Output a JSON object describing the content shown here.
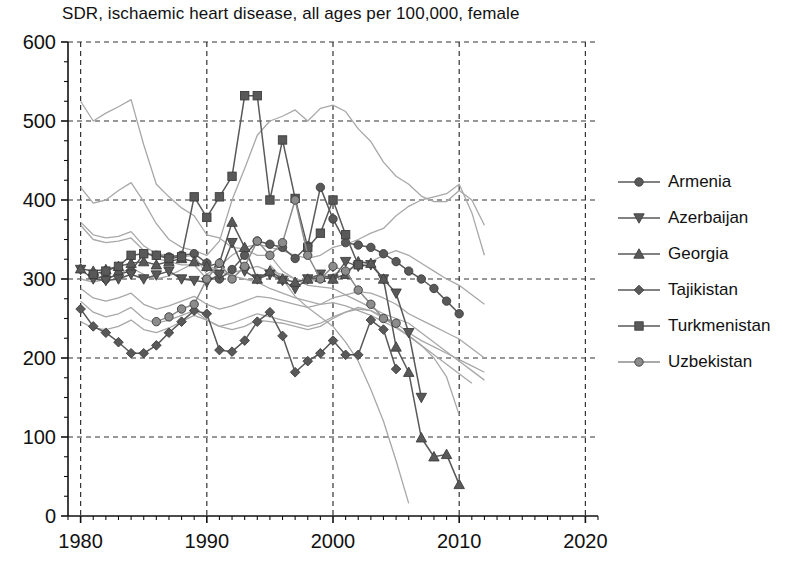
{
  "chart_data": {
    "type": "line",
    "title": "SDR, ischaemic heart disease, all ages per 100,000, female",
    "xlabel": "",
    "ylabel": "",
    "xlim": [
      1979,
      2021
    ],
    "ylim": [
      0,
      600
    ],
    "xticks": [
      "1980",
      "1990",
      "2000",
      "2010",
      "2020"
    ],
    "yticks": [
      "0",
      "100",
      "200",
      "300",
      "400",
      "500",
      "600"
    ],
    "xtick_values": [
      1980,
      1990,
      2000,
      2010,
      2020
    ],
    "ytick_values": [
      0,
      100,
      200,
      300,
      400,
      500,
      600
    ],
    "x_minor_step": 1,
    "y_minor_step": 25,
    "grid": "dashed",
    "legend_position": "right",
    "colors": {
      "highlight": "#595959",
      "background_line": "#a8a8a8",
      "axis": "#111111",
      "grid": "#333333"
    },
    "series": [
      {
        "name": "Armenia",
        "marker": "circle",
        "highlight": true,
        "color": "#595959",
        "x": [
          1981,
          1982,
          1983,
          1984,
          1985,
          1986,
          1987,
          1988,
          1989,
          1990,
          1991,
          1992,
          1993,
          1994,
          1995,
          1996,
          1997,
          1998,
          1999,
          2000,
          2001,
          2002,
          2003,
          2004,
          2005,
          2006,
          2007,
          2008,
          2009,
          2010
        ],
        "y": [
          304,
          300,
          306,
          310,
          332,
          330,
          328,
          330,
          332,
          320,
          300,
          312,
          330,
          348,
          344,
          340,
          326,
          342,
          416,
          376,
          346,
          343,
          340,
          332,
          322,
          310,
          300,
          288,
          272,
          256
        ]
      },
      {
        "name": "Azerbaijan",
        "marker": "triangle-down",
        "highlight": true,
        "color": "#595959",
        "x": [
          1980,
          1981,
          1982,
          1983,
          1984,
          1985,
          1986,
          1987,
          1988,
          1989,
          1990,
          1991,
          1992,
          1993,
          1994,
          1995,
          1996,
          1997,
          1998,
          1999,
          2000,
          2001,
          2002,
          2003,
          2004,
          2005,
          2006,
          2007
        ],
        "y": [
          312,
          300,
          298,
          300,
          306,
          300,
          305,
          310,
          300,
          298,
          296,
          306,
          346,
          310,
          300,
          306,
          298,
          288,
          300,
          306,
          300,
          322,
          316,
          318,
          300,
          282,
          232,
          150
        ]
      },
      {
        "name": "Georgia",
        "marker": "triangle-up",
        "highlight": true,
        "color": "#595959",
        "x": [
          1980,
          1981,
          1982,
          1983,
          1984,
          1985,
          1986,
          1987,
          1988,
          1989,
          1990,
          1991,
          1992,
          1993,
          1994,
          1995,
          1996,
          1997,
          1998,
          1999,
          2000,
          2001,
          2002,
          2003,
          2004,
          2005,
          2006,
          2007,
          2008,
          2009,
          2010
        ],
        "y": [
          313,
          310,
          312,
          316,
          320,
          322,
          318,
          322,
          326,
          322,
          316,
          320,
          372,
          340,
          300,
          310,
          300,
          296,
          300,
          302,
          300,
          306,
          322,
          320,
          300,
          214,
          182,
          99,
          75,
          78,
          40
        ]
      },
      {
        "name": "Tajikistan",
        "marker": "diamond",
        "highlight": true,
        "color": "#595959",
        "x": [
          1980,
          1981,
          1982,
          1983,
          1984,
          1985,
          1986,
          1987,
          1988,
          1989,
          1990,
          1991,
          1992,
          1993,
          1994,
          1995,
          1996,
          1997,
          1998,
          1999,
          2000,
          2001,
          2002,
          2003,
          2004,
          2005
        ],
        "y": [
          262,
          240,
          232,
          220,
          206,
          206,
          216,
          232,
          246,
          260,
          256,
          210,
          208,
          222,
          246,
          258,
          228,
          182,
          196,
          206,
          222,
          204,
          204,
          248,
          236,
          186
        ]
      },
      {
        "name": "Turkmenistan",
        "marker": "square",
        "highlight": true,
        "color": "#595959",
        "x": [
          1981,
          1982,
          1983,
          1984,
          1985,
          1986,
          1987,
          1988,
          1989,
          1990,
          1991,
          1992,
          1993,
          1994,
          1995,
          1996,
          1997,
          1998,
          1999,
          2000,
          2001,
          2002
        ],
        "y": [
          306,
          310,
          316,
          330,
          332,
          330,
          326,
          328,
          404,
          378,
          404,
          430,
          532,
          532,
          400,
          476,
          402,
          340,
          358,
          400,
          356,
          318
        ]
      },
      {
        "name": "Uzbekistan",
        "marker": "circle-light",
        "highlight": true,
        "color": "#8c8c8c",
        "x": [
          1986,
          1987,
          1988,
          1989,
          1990,
          1991,
          1992,
          1993,
          1994,
          1995,
          1996,
          1997,
          1998,
          1999,
          2000,
          2001,
          2002,
          2003,
          2004,
          2005
        ],
        "y": [
          246,
          252,
          262,
          268,
          300,
          320,
          300,
          316,
          348,
          330,
          346,
          400,
          330,
          300,
          316,
          310,
          286,
          268,
          250,
          244
        ]
      }
    ],
    "background_series": [
      {
        "name": "background-1",
        "x": [
          1980,
          1981,
          1982,
          1983,
          1984,
          1985,
          1986,
          1987,
          1988,
          1989,
          1990,
          1991,
          1992,
          1993,
          1994,
          1995,
          1996,
          1997,
          1998,
          1999,
          2000,
          2001,
          2002,
          2003,
          2004,
          2005,
          2006,
          2007,
          2008,
          2009,
          2010,
          2011,
          2012
        ],
        "y": [
          525,
          500,
          510,
          518,
          527,
          470,
          420,
          404,
          390,
          380,
          356,
          352,
          340,
          338,
          330,
          330,
          310,
          300,
          292,
          290,
          288,
          280,
          272,
          264,
          256,
          250,
          244,
          232,
          220,
          208,
          196,
          184,
          172
        ]
      },
      {
        "name": "background-2",
        "x": [
          1980,
          1981,
          1982,
          1983,
          1984,
          1985,
          1986,
          1987,
          1988,
          1989,
          1990,
          1991,
          1992,
          1993,
          1994,
          1995,
          1996,
          1997,
          1998,
          1999,
          2000,
          2001,
          2002,
          2003,
          2004,
          2005,
          2006,
          2007,
          2008,
          2009,
          2010,
          2011,
          2012
        ],
        "y": [
          416,
          396,
          400,
          412,
          422,
          398,
          370,
          350,
          340,
          336,
          330,
          348,
          400,
          440,
          482,
          500,
          506,
          514,
          500,
          516,
          520,
          512,
          490,
          474,
          448,
          430,
          420,
          405,
          398,
          398,
          412,
          400,
          368
        ]
      },
      {
        "name": "background-3",
        "x": [
          1980,
          1981,
          1982,
          1983,
          1984,
          1985,
          1986,
          1987,
          1988,
          1989,
          1990,
          1991,
          1992,
          1993,
          1994,
          1995,
          1996,
          1997,
          1998,
          1999,
          2000,
          2001,
          2002,
          2003,
          2004,
          2005,
          2006,
          2007,
          2008,
          2009,
          2010,
          2011,
          2012
        ],
        "y": [
          372,
          356,
          352,
          354,
          360,
          342,
          332,
          330,
          328,
          330,
          306,
          316,
          330,
          340,
          344,
          340,
          336,
          330,
          326,
          330,
          340,
          344,
          350,
          358,
          364,
          380,
          392,
          400,
          404,
          408,
          420,
          384,
          330
        ]
      },
      {
        "name": "background-4",
        "x": [
          1980,
          1981,
          1982,
          1983,
          1984,
          1985,
          1986,
          1987,
          1988,
          1989,
          1990,
          1991,
          1992,
          1993,
          1994,
          1995,
          1996,
          1997,
          1998,
          1999,
          2000,
          2001,
          2002,
          2003,
          2004,
          2005,
          2006,
          2007,
          2008,
          2009,
          2010,
          2011,
          2012
        ],
        "y": [
          368,
          350,
          346,
          348,
          352,
          336,
          326,
          322,
          318,
          318,
          300,
          302,
          308,
          312,
          316,
          310,
          306,
          300,
          296,
          300,
          306,
          312,
          316,
          322,
          330,
          336,
          330,
          320,
          310,
          300,
          292,
          280,
          268
        ]
      },
      {
        "name": "background-5",
        "x": [
          1980,
          1981,
          1982,
          1983,
          1984,
          1985,
          1986,
          1987,
          1988,
          1989,
          1990,
          1991,
          1992,
          1993,
          1994,
          1995,
          1996,
          1997,
          1998,
          1999,
          2000,
          2001,
          2002,
          2003,
          2004,
          2005,
          2006,
          2007,
          2008,
          2009,
          2010,
          2011,
          2012
        ],
        "y": [
          288,
          276,
          272,
          276,
          282,
          268,
          262,
          266,
          272,
          278,
          268,
          262,
          266,
          272,
          278,
          276,
          272,
          268,
          264,
          268,
          276,
          280,
          284,
          282,
          276,
          268,
          256,
          248,
          240,
          232,
          224,
          212,
          200
        ]
      },
      {
        "name": "background-6",
        "x": [
          1980,
          1981,
          1982,
          1983,
          1984,
          1985,
          1986,
          1987,
          1988,
          1989,
          1990,
          1991,
          1992,
          1993,
          1994,
          1995,
          1996,
          1997,
          1998,
          1999,
          2000,
          2001,
          2002,
          2003,
          2004,
          2005,
          2006,
          2007,
          2008,
          2009,
          2010,
          2011,
          2012
        ],
        "y": [
          272,
          258,
          252,
          256,
          264,
          250,
          244,
          248,
          254,
          260,
          248,
          240,
          244,
          250,
          256,
          252,
          248,
          244,
          240,
          244,
          252,
          258,
          262,
          260,
          252,
          244,
          232,
          222,
          214,
          206,
          198,
          190,
          182
        ]
      },
      {
        "name": "background-7",
        "x": [
          1980,
          1981,
          1982,
          1983,
          1984,
          1985,
          1986,
          1987,
          1988,
          1989,
          1990,
          1991,
          1992,
          1993,
          1994,
          1995,
          1996,
          1997,
          1998,
          1999,
          2000,
          2001,
          2002,
          2003,
          2004,
          2005,
          2006,
          2007,
          2008,
          2009,
          2010
        ],
        "y": [
          300,
          296,
          300,
          306,
          314,
          306,
          300,
          304,
          312,
          320,
          318,
          310,
          304,
          300,
          296,
          288,
          282,
          276,
          272,
          268,
          270,
          266,
          260,
          254,
          246,
          238,
          228,
          216,
          200,
          176,
          128
        ]
      },
      {
        "name": "background-8",
        "x": [
          1995,
          1996,
          1997,
          1998,
          1999,
          2000,
          2001,
          2002,
          2003,
          2004,
          2005,
          2006
        ],
        "y": [
          318,
          300,
          278,
          264,
          252,
          240,
          220,
          196,
          160,
          120,
          70,
          16
        ]
      },
      {
        "name": "background-9",
        "x": [
          1980,
          1981,
          1982,
          1983,
          1984,
          1985,
          1986,
          1987,
          1988,
          1989,
          1990,
          1991,
          1992,
          1993,
          1994,
          1995,
          1996,
          1997,
          1998,
          1999,
          2000,
          2001,
          2002,
          2003,
          2004,
          2005,
          2006,
          2007,
          2008,
          2009,
          2010,
          2011
        ],
        "y": [
          246,
          238,
          236,
          240,
          248,
          236,
          232,
          238,
          246,
          254,
          248,
          240,
          236,
          240,
          248,
          246,
          244,
          240,
          236,
          240,
          250,
          258,
          264,
          260,
          250,
          240,
          228,
          216,
          204,
          192,
          180,
          168
        ]
      }
    ]
  },
  "legend": {
    "items": [
      {
        "label": "Armenia",
        "marker": "circle"
      },
      {
        "label": "Azerbaijan",
        "marker": "triangle-down"
      },
      {
        "label": "Georgia",
        "marker": "triangle-up"
      },
      {
        "label": "Tajikistan",
        "marker": "diamond"
      },
      {
        "label": "Turkmenistan",
        "marker": "square"
      },
      {
        "label": "Uzbekistan",
        "marker": "circle-light"
      }
    ]
  }
}
